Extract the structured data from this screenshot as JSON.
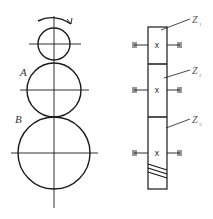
{
  "diagram": {
    "type": "gear-train",
    "colors": {
      "stroke": "#1a1a1a",
      "label": "#333333"
    },
    "front_view": {
      "rotation_arrow": "clockwise-arrow",
      "gears": [
        {
          "id": "top",
          "cx": 54,
          "cy": 44,
          "r": 16,
          "label": ""
        },
        {
          "id": "A",
          "cx": 54,
          "cy": 90,
          "r": 27,
          "label": "A"
        },
        {
          "id": "B",
          "cx": 54,
          "cy": 153,
          "r": 36,
          "label": "B"
        }
      ]
    },
    "side_view": {
      "gears": [
        {
          "label": "Z",
          "sub": "1",
          "top": 27,
          "bottom": 64,
          "axis_y": 45
        },
        {
          "label": "Z",
          "sub": "2",
          "top": 64,
          "bottom": 117,
          "axis_y": 90
        },
        {
          "label": "Z",
          "sub": "3",
          "top": 117,
          "bottom": 189,
          "axis_y": 153
        }
      ],
      "center_mark": "x"
    }
  }
}
